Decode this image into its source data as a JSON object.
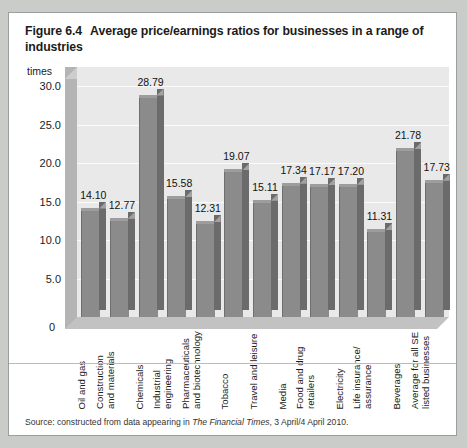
{
  "figure": {
    "number": "Figure 6.4",
    "title": "Average price/earnings ratios for businesses in a range of industries",
    "source_prefix": "Source: constructed from data appearing in ",
    "source_italic": "The Financial Times",
    "source_suffix": ", 3 April/4 April 2010."
  },
  "chart_data": {
    "type": "bar",
    "title": "Average price/earnings ratios for businesses in a range of industries",
    "xlabel": "",
    "ylabel": "times",
    "ylim": [
      0,
      32.5
    ],
    "yticks": [
      "0",
      "5.0",
      "10.0",
      "15.0",
      "20.0",
      "25.0",
      "30.0"
    ],
    "ytick_values": [
      0,
      5,
      10,
      15,
      20,
      25,
      30
    ],
    "grid": true,
    "legend": "none",
    "categories": [
      "Oil and gas",
      "Construction and materials",
      "Chemicals",
      "Industrial engineering",
      "Pharmaceuticals and biotechnology",
      "Tobacco",
      "Travel and leisure",
      "Media",
      "Food and drug retailers",
      "Electricity",
      "Life insurance/ assurance",
      "Beverages",
      "Average for all SE listed businesses"
    ],
    "categories_lines": [
      [
        "Oil and gas"
      ],
      [
        "Construction",
        "and  materials"
      ],
      [
        "Chemicals"
      ],
      [
        "Industrial",
        "engineering"
      ],
      [
        "Pharmaceuticals",
        "and biotechnology"
      ],
      [
        "Tobacco"
      ],
      [
        "Travel and leisure"
      ],
      [
        "Media"
      ],
      [
        "Food and drug",
        "retailers"
      ],
      [
        "Electricity"
      ],
      [
        "Life insurance/",
        "assurance"
      ],
      [
        "Beverages"
      ],
      [
        "Average for all SE",
        "listed businesses"
      ]
    ],
    "values": [
      14.1,
      12.77,
      28.79,
      15.58,
      12.31,
      19.07,
      15.11,
      17.34,
      17.17,
      17.2,
      11.31,
      21.78,
      17.73
    ],
    "value_labels": [
      "14.10",
      "12.77",
      "28.79",
      "15.58",
      "12.31",
      "19.07",
      "15.11",
      "17.34",
      "17.17",
      "17.20",
      "11.31",
      "21.78",
      "17.73"
    ],
    "bar_color": "#8b8b8b",
    "plot_background": "#e9e9e9"
  }
}
